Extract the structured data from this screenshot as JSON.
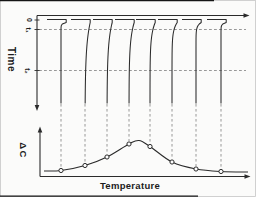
{
  "figure": {
    "description_visible": false
  },
  "colors": {
    "line": "#2b2b2b",
    "dashed": "#8c8c8c",
    "background": "#fbfbfa",
    "marker_fill": "#fdfdfd",
    "scan_line": "#151515",
    "border": "#c6c6c6"
  },
  "chart_data": [
    {
      "type": "line",
      "title": "",
      "xlabel": "",
      "ylabel": "Time",
      "y_ticks": [
        "0",
        "t₁",
        "t₂"
      ],
      "ticks": [
        {
          "label": "0",
          "y": 20,
          "dashed": false
        },
        {
          "label": "t₁",
          "y": 29.5,
          "dashed": true
        },
        {
          "label": "t₂",
          "y": 70.5,
          "dashed": true
        }
      ],
      "axis": {
        "x0": 37,
        "top_y": 15.5,
        "x_end": 244,
        "arrow_x": 249.5,
        "y_end": 105.5,
        "arrow_y": 111
      },
      "zero_level_y": 19.5,
      "step_width": 5.2,
      "step_bottom_y": 22.5,
      "h_seg_left": 14,
      "solid_end_y": 104,
      "dash_line_x_end": 246,
      "traces": [
        {
          "x": 61,
          "converge_y": 26,
          "marker_y": 170.5
        },
        {
          "x": 85,
          "converge_y": 97,
          "marker_y": 165.5
        },
        {
          "x": 107,
          "converge_y": 88,
          "marker_y": 157
        },
        {
          "x": 129,
          "converge_y": 77,
          "marker_y": 144
        },
        {
          "x": 150,
          "converge_y": 62,
          "marker_y": 146.5
        },
        {
          "x": 172,
          "converge_y": 47,
          "marker_y": 162
        },
        {
          "x": 196,
          "converge_y": 33,
          "marker_y": 169
        },
        {
          "x": 221,
          "converge_y": 27,
          "marker_y": 171.5
        }
      ]
    },
    {
      "type": "line",
      "title": "",
      "xlabel": "Temperature",
      "ylabel": "ΔC",
      "axis": {
        "x0": 40,
        "y0": 176.5,
        "x_end": 245.5,
        "arrow_x": 250.5,
        "y_top": 131,
        "arrow_y": 126.5
      },
      "curve_points": [
        [
          44,
          171
        ],
        [
          61,
          170.5
        ],
        [
          85,
          165.5
        ],
        [
          107,
          157
        ],
        [
          129,
          144
        ],
        [
          139,
          140.5
        ],
        [
          150,
          146.5
        ],
        [
          172,
          162
        ],
        [
          196,
          169
        ],
        [
          221,
          171.5
        ],
        [
          248,
          172
        ]
      ],
      "peak": {
        "x": 139,
        "y": 140.5
      },
      "marker_x_from_top_traces": true
    }
  ]
}
